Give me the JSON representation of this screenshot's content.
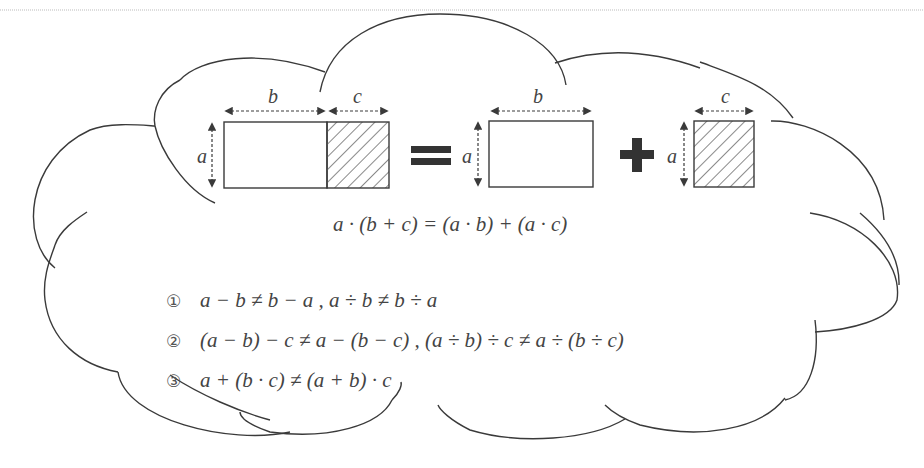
{
  "diagram": {
    "labels": {
      "left_width_b": "b",
      "left_width_c": "c",
      "left_height_a": "a",
      "mid_width_b": "b",
      "mid_height_a": "a",
      "right_width_c": "c",
      "right_height_a": "a"
    },
    "operators": {
      "equals": "=",
      "plus": "+"
    },
    "main_formula": "a · (b + c) = (a · b) + (a · c)",
    "statements": [
      {
        "marker": "①",
        "text": "a − b ≠ b − a ,   a ÷ b ≠ b ÷ a"
      },
      {
        "marker": "②",
        "text": "(a − b) − c ≠ a − (b − c) ,   (a ÷ b) ÷ c ≠ a ÷ (b ÷ c)"
      },
      {
        "marker": "③",
        "text": "a + (b · c) ≠ (a + b) · c"
      }
    ],
    "colors": {
      "outline": "#3a3a3a",
      "hatch": "#8a8a8a",
      "text": "#444444",
      "operator": "#333333"
    }
  }
}
